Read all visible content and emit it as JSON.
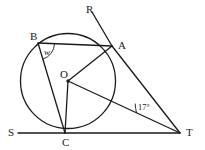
{
  "figure": {
    "kind": "circle-geometry-diagram",
    "stroke_color": "#1a1a1a",
    "background_color": "#ffffff",
    "width": 205,
    "height": 150
  },
  "circle": {
    "center_label": "O",
    "cx": 68,
    "cy": 81,
    "r": 47.5
  },
  "points": [
    {
      "id": "R",
      "label": "R",
      "x": 92,
      "y": 12,
      "label_x": 86,
      "label_y": 4
    },
    {
      "id": "B",
      "label": "B",
      "x": 38,
      "y": 43,
      "label_x": 30,
      "label_y": 31
    },
    {
      "id": "A",
      "label": "A",
      "x": 112,
      "y": 46,
      "label_x": 118,
      "label_y": 40
    },
    {
      "id": "O",
      "label": "O",
      "x": 68,
      "y": 81,
      "label_x": 60,
      "label_y": 69
    },
    {
      "id": "S",
      "label": "S",
      "x": 18,
      "y": 133,
      "label_x": 8,
      "label_y": 127
    },
    {
      "id": "C",
      "label": "C",
      "x": 65,
      "y": 133,
      "label_x": 62,
      "label_y": 137
    },
    {
      "id": "T",
      "label": "T",
      "x": 180,
      "y": 133,
      "label_x": 186,
      "label_y": 127
    }
  ],
  "segments": [
    {
      "name": "segment-R-A",
      "from": "R",
      "to": "A"
    },
    {
      "name": "segment-B-A",
      "from": "B",
      "to": "A"
    },
    {
      "name": "segment-B-C",
      "from": "B",
      "to": "C"
    },
    {
      "name": "segment-O-A",
      "from": "O",
      "to": "A"
    },
    {
      "name": "segment-O-C",
      "from": "O",
      "to": "C"
    },
    {
      "name": "segment-O-T",
      "from": "O",
      "to": "T"
    },
    {
      "name": "segment-A-T",
      "from": "A",
      "to": "T"
    },
    {
      "name": "tangent-S-T",
      "from": "S",
      "to": "T"
    }
  ],
  "angles": [
    {
      "name": "angle-w-at-B",
      "label": "w",
      "vertex": "B",
      "label_x": 44,
      "label_y": 48
    },
    {
      "name": "angle-17-at-T",
      "label": "17°",
      "vertex": "T",
      "label_x": 138,
      "label_y": 103
    }
  ]
}
